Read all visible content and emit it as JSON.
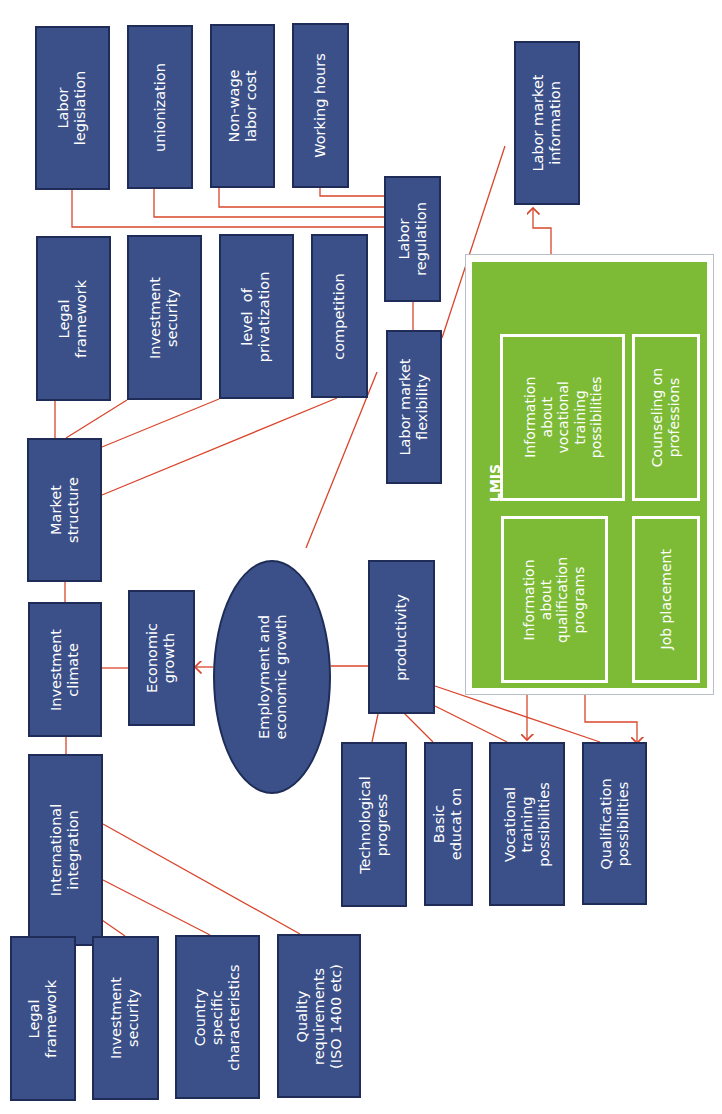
{
  "colors": {
    "box_fill": "#3b5089",
    "box_border": "#1e2c57",
    "connector": "#d9452b",
    "lmis_green": "#7dbb37",
    "text": "#ffffff"
  },
  "orientation": "rotated-90-ccw",
  "center": {
    "label": "Employment and\neconomic growth"
  },
  "investment_branch": {
    "economic_growth": "Economic\ngrowth",
    "investment_climate": "Investment\nclimate",
    "market_structure": {
      "label": "Market\nstructure",
      "children": [
        "Legal\nframework",
        "Investment\nsecurity",
        "level  of\nprivatization",
        "competition"
      ]
    },
    "international_integration": {
      "label": "International\nintegration",
      "children": [
        "Legal\nframework",
        "Investment\nsecurity",
        "Country\nspecific\ncharacteristics",
        "Quality\nrequirements\n(ISO 1400 etc)"
      ]
    }
  },
  "labor_branch": {
    "labor_market_flexibility": "Labor market\nflexibility",
    "labor_regulation": {
      "label": "Labor\nregulation",
      "children": [
        "Labor\nlegislation",
        "unionization",
        "Non-wage\nlabor cost",
        "Working hours"
      ]
    },
    "labor_market_information": "Labor market\ninformation"
  },
  "productivity_branch": {
    "label": "productivity",
    "children": [
      "Technological\nprogress",
      "Basic\neducat on",
      "Vocational\ntraining\npossibilities",
      "Qualification\npossibilities"
    ]
  },
  "lmis": {
    "title": "LMIS",
    "items": [
      "Information\nabout\nvocational\ntraining\npossibilities",
      "Counseling on\nprofessions",
      "Information\nabout\nqualification\nprograms",
      "Job placement"
    ]
  }
}
